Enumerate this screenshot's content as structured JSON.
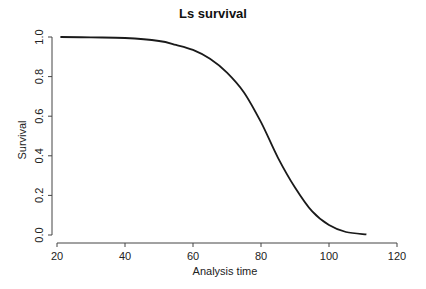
{
  "chart_data": {
    "type": "line",
    "title": "Ls survival",
    "xlabel": "Analysis time",
    "ylabel": "Survival",
    "xlim": [
      20,
      120
    ],
    "ylim": [
      0,
      1
    ],
    "x_ticks": [
      20,
      40,
      60,
      80,
      100,
      120
    ],
    "y_ticks": [
      0.0,
      0.2,
      0.4,
      0.6,
      0.8,
      1.0
    ],
    "x_tick_labels": [
      "20",
      "40",
      "60",
      "80",
      "100",
      "120"
    ],
    "y_tick_labels": [
      "0.0",
      "0.2",
      "0.4",
      "0.6",
      "0.8",
      "1.0"
    ],
    "grid": false,
    "legend": null,
    "series": [
      {
        "name": "Ls survival",
        "x": [
          21,
          30,
          40,
          50,
          55,
          60,
          65,
          70,
          75,
          80,
          85,
          90,
          95,
          100,
          105,
          111
        ],
        "y": [
          1.0,
          0.998,
          0.995,
          0.98,
          0.96,
          0.935,
          0.89,
          0.82,
          0.72,
          0.57,
          0.39,
          0.24,
          0.12,
          0.05,
          0.015,
          0.003
        ]
      }
    ]
  }
}
